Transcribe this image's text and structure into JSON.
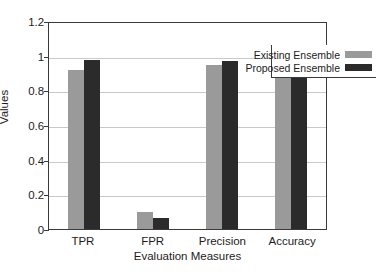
{
  "chart_data": {
    "type": "bar",
    "title": "",
    "xlabel": "Evaluation Measures",
    "ylabel": "Values",
    "categories": [
      "TPR",
      "FPR",
      "Precision",
      "Accuracy"
    ],
    "series": [
      {
        "name": "Existing Ensemble",
        "color": "#9a9a9a",
        "values": [
          0.915,
          0.1,
          0.945,
          0.98
        ]
      },
      {
        "name": "Proposed Ensemble",
        "color": "#2b2b2b",
        "values": [
          0.975,
          0.062,
          0.97,
          0.99
        ]
      }
    ],
    "ylim": [
      0,
      1.2
    ],
    "yticks": [
      0,
      0.2,
      0.4,
      0.6,
      0.8,
      1,
      1.2
    ],
    "ytick_labels": [
      "0",
      "0.2",
      "0.4",
      "0.6",
      "0.8",
      "1",
      "1.2"
    ],
    "grid": true,
    "grid_axis": "y",
    "legend_position": "top-right",
    "legend": [
      "Existing Ensemble",
      "Proposed Ensemble"
    ]
  }
}
